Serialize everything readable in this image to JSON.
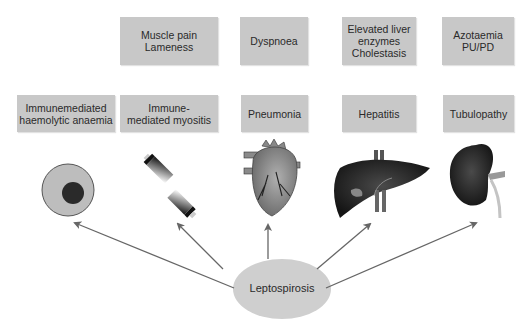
{
  "diagram": {
    "center": {
      "label": "Leptospirosis",
      "fill": "#cfcfcf"
    },
    "columns": [
      {
        "id": "cell",
        "icon": "red-blood-cell-icon",
        "condition": "Immunemediated\nhaemolytic anaemia",
        "sign": null
      },
      {
        "id": "muscle",
        "icon": "muscle-fiber-icon",
        "condition": "Immune-\nmediated myositis",
        "sign": "Muscle pain\nLameness"
      },
      {
        "id": "heart",
        "icon": "heart-icon",
        "condition": "Pneumonia",
        "sign": "Dyspnoea"
      },
      {
        "id": "liver",
        "icon": "liver-icon",
        "condition": "Hepatitis",
        "sign": "Elevated liver\nenzymes\nCholestasis"
      },
      {
        "id": "kidney",
        "icon": "kidney-icon",
        "condition": "Tubulopathy",
        "sign": "Azotaemia\nPU/PD"
      }
    ],
    "colors": {
      "box": "#c8c8c8",
      "arrow": "#666666",
      "organ_dark": "#1e1e1e"
    }
  }
}
